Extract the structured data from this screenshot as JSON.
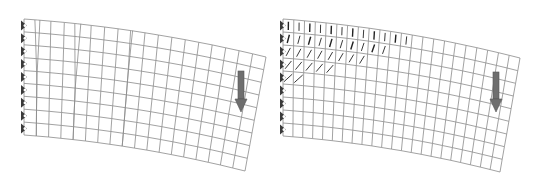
{
  "figure": {
    "panels": [
      {
        "id": "left",
        "description": "Deformed FE mesh of cantilever with discrete cracks",
        "rows": 9,
        "cols": 18,
        "corners": {
          "tl": [
            24,
            19
          ],
          "tr": [
            266,
            57
          ],
          "bl": [
            24,
            135
          ],
          "br": [
            245,
            171
          ]
        },
        "cracks": [
          {
            "after_col": 1,
            "depth_rows": 4.5,
            "gap": 5
          },
          {
            "after_col": 4,
            "depth_rows": 5,
            "gap": 6
          },
          {
            "after_col": 8,
            "depth_rows": 3.5,
            "gap": 2
          }
        ],
        "support_count": 9,
        "load_arrow": {
          "x": 241,
          "y1": 71,
          "y2": 112
        }
      },
      {
        "id": "right",
        "description": "Deformed FE mesh of cantilever with smeared cracking",
        "rows": 9,
        "cols": 22,
        "corners": {
          "tl": [
            283,
            19
          ],
          "tr": [
            520,
            58
          ],
          "bl": [
            283,
            136
          ],
          "br": [
            500,
            172
          ]
        },
        "crack_zone_cols": 12,
        "crack_zone_rows": 5,
        "support_count": 9,
        "load_arrow": {
          "x": 496,
          "y1": 72,
          "y2": 112
        }
      }
    ],
    "colors": {
      "mesh": "#8a8a8a",
      "crack": "#222222",
      "support": "#3a3a3a",
      "arrow": "#6e6e6e",
      "arrow_edge": "#555555"
    }
  }
}
